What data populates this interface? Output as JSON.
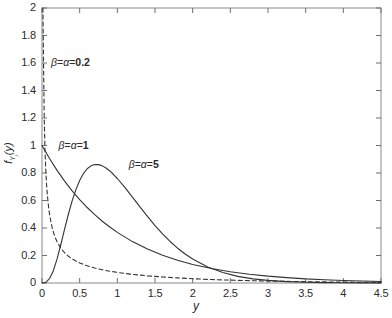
{
  "chart_data": {
    "type": "line",
    "title": "",
    "xlabel": "y",
    "ylabel": "f_{Y_j}(y)",
    "xlim": [
      0,
      4.5
    ],
    "ylim": [
      0,
      2
    ],
    "grid": false,
    "legend_position": "inline-annotations",
    "xticks": [
      "0",
      "0.5",
      "1",
      "1.5",
      "2",
      "2.5",
      "3",
      "3.5",
      "4",
      "4.5"
    ],
    "xtick_values": [
      0,
      0.5,
      1,
      1.5,
      2,
      2.5,
      3,
      3.5,
      4,
      4.5
    ],
    "yticks": [
      "0",
      "0.2",
      "0.4",
      "0.6",
      "0.8",
      "1",
      "1.2",
      "1.4",
      "1.6",
      "1.8",
      "2"
    ],
    "ytick_values": [
      0,
      0.2,
      0.4,
      0.6,
      0.8,
      1.0,
      1.2,
      1.4,
      1.6,
      1.8,
      2.0
    ],
    "series": [
      {
        "name": "beta = alpha = 0.2",
        "label": "β = α = 0.2",
        "alpha": 0.2,
        "beta": 0.2,
        "style": "dashed",
        "color": "#333333",
        "annotation_xy": [
          0.12,
          1.6
        ],
        "x": [
          0.012,
          0.02,
          0.03,
          0.04,
          0.05,
          0.06,
          0.07,
          0.08,
          0.09,
          0.1,
          0.12,
          0.14,
          0.16,
          0.18,
          0.2,
          0.25,
          0.3,
          0.35,
          0.4,
          0.5,
          0.6,
          0.7,
          0.8,
          0.9,
          1.0,
          1.2,
          1.4,
          1.6,
          1.8,
          2.0,
          2.25,
          2.5,
          2.75,
          3.0,
          3.25,
          3.5,
          3.75,
          4.0,
          4.25,
          4.5
        ],
        "y": [
          2.0,
          1.62,
          1.19,
          0.96,
          0.82,
          0.72,
          0.65,
          0.59,
          0.54,
          0.5,
          0.44,
          0.39,
          0.355,
          0.325,
          0.3,
          0.253,
          0.22,
          0.195,
          0.175,
          0.146,
          0.125,
          0.109,
          0.096,
          0.086,
          0.077,
          0.063,
          0.052,
          0.044,
          0.037,
          0.031,
          0.025,
          0.021,
          0.017,
          0.014,
          0.012,
          0.0095,
          0.008,
          0.0065,
          0.0055,
          0.0045
        ]
      },
      {
        "name": "beta = alpha = 1",
        "label": "β = α = 1",
        "alpha": 1,
        "beta": 1,
        "style": "solid",
        "color": "#333333",
        "annotation_xy": [
          0.22,
          1.0
        ],
        "x": [
          0,
          0.1,
          0.2,
          0.3,
          0.4,
          0.5,
          0.6,
          0.7,
          0.8,
          0.9,
          1.0,
          1.2,
          1.4,
          1.6,
          1.8,
          2.0,
          2.25,
          2.5,
          2.75,
          3.0,
          3.25,
          3.5,
          3.75,
          4.0,
          4.25,
          4.5
        ],
        "y": [
          1.0,
          0.905,
          0.819,
          0.741,
          0.67,
          0.607,
          0.549,
          0.497,
          0.449,
          0.407,
          0.368,
          0.301,
          0.247,
          0.202,
          0.165,
          0.135,
          0.105,
          0.082,
          0.064,
          0.05,
          0.039,
          0.03,
          0.024,
          0.018,
          0.014,
          0.011
        ]
      },
      {
        "name": "beta = alpha = 5",
        "label": "β = α = 5",
        "alpha": 5,
        "beta": 5,
        "style": "solid",
        "color": "#333333",
        "annotation_xy": [
          1.15,
          0.86
        ],
        "peak_x": 0.8,
        "peak_y": 0.98,
        "x": [
          0,
          0.05,
          0.1,
          0.15,
          0.2,
          0.25,
          0.3,
          0.35,
          0.4,
          0.45,
          0.5,
          0.55,
          0.6,
          0.65,
          0.7,
          0.75,
          0.8,
          0.85,
          0.9,
          0.95,
          1.0,
          1.1,
          1.2,
          1.3,
          1.4,
          1.5,
          1.6,
          1.7,
          1.8,
          1.9,
          2.0,
          2.2,
          2.4,
          2.6,
          2.8,
          3.0,
          3.25,
          3.5,
          3.75,
          4.0,
          4.25,
          4.5
        ],
        "y": [
          0.0,
          0.005,
          0.032,
          0.088,
          0.175,
          0.28,
          0.392,
          0.5,
          0.597,
          0.679,
          0.746,
          0.796,
          0.831,
          0.852,
          0.862,
          0.861,
          0.852,
          0.836,
          0.815,
          0.789,
          0.76,
          0.695,
          0.625,
          0.554,
          0.484,
          0.418,
          0.357,
          0.302,
          0.253,
          0.211,
          0.174,
          0.116,
          0.076,
          0.048,
          0.03,
          0.019,
          0.01,
          0.005,
          0.0025,
          0.0013,
          0.0006,
          0.0003
        ]
      }
    ]
  },
  "axes": {
    "x_axis_label": "y",
    "y_axis_label_parts": {
      "f": "f",
      "sub": "Y",
      "subsub": "j",
      "arg": "(y)"
    }
  }
}
